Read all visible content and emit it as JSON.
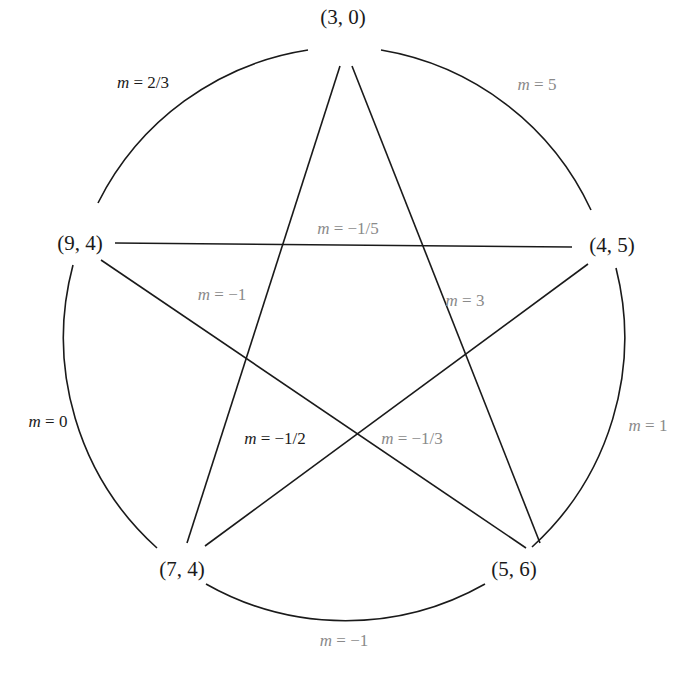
{
  "diagram": {
    "title": "",
    "vertices": [
      {
        "id": "v30",
        "label": "(3, 0)",
        "x": 343,
        "y": 17
      },
      {
        "id": "v94",
        "label": "(9, 4)",
        "x": 80,
        "y": 243
      },
      {
        "id": "v45",
        "label": "(4, 5)",
        "x": 612,
        "y": 245
      },
      {
        "id": "v74",
        "label": "(7, 4)",
        "x": 182,
        "y": 569
      },
      {
        "id": "v56",
        "label": "(5, 6)",
        "x": 514,
        "y": 569
      }
    ],
    "arc_slopes": [
      {
        "id": "arc-30-94",
        "var": "m",
        "text": " = 2/3",
        "tone": "dark",
        "x": 143,
        "y": 83
      },
      {
        "id": "arc-30-45",
        "var": "m",
        "text": " = 5",
        "tone": "gray",
        "x": 537,
        "y": 85
      },
      {
        "id": "arc-94-74",
        "var": "m",
        "text": " = 0",
        "tone": "dark",
        "x": 48,
        "y": 422
      },
      {
        "id": "arc-45-56",
        "var": "m",
        "text": " = 1",
        "tone": "gray",
        "x": 648,
        "y": 426
      },
      {
        "id": "arc-74-56",
        "var": "m",
        "text": " = −1",
        "tone": "gray",
        "x": 344,
        "y": 641
      }
    ],
    "chord_slopes": [
      {
        "id": "chord-94-45",
        "var": "m",
        "text": " = −1/5",
        "tone": "gray",
        "x": 348,
        "y": 229
      },
      {
        "id": "chord-30-74",
        "var": "m",
        "text": " = −1",
        "tone": "gray",
        "x": 222,
        "y": 295
      },
      {
        "id": "chord-30-56",
        "var": "m",
        "text": " = 3",
        "tone": "gray",
        "x": 465,
        "y": 301
      },
      {
        "id": "chord-94-56",
        "var": "m",
        "text": " = −1/2",
        "tone": "dark",
        "x": 275,
        "y": 439
      },
      {
        "id": "chord-45-74",
        "var": "m",
        "text": " = −1/3",
        "tone": "gray",
        "x": 412,
        "y": 439
      }
    ],
    "colors": {
      "line": "#1a1a1a",
      "dark_text": "#1a1a1a",
      "gray_text": "#8a8a8a",
      "background": "#ffffff"
    }
  }
}
